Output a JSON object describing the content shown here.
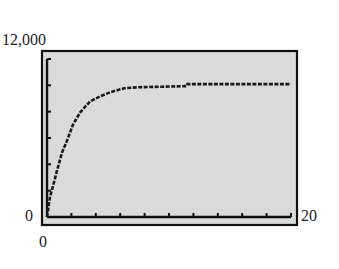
{
  "chart_data": {
    "type": "line",
    "title": "",
    "xlabel": "",
    "ylabel": "",
    "xlim": [
      0,
      20
    ],
    "ylim": [
      0,
      12000
    ],
    "x_tick_labels": {
      "min": "0",
      "max": "20"
    },
    "y_tick_labels": {
      "min": "0",
      "max": "12,000"
    },
    "x_tick_interval": 2,
    "y_tick_interval": 2000,
    "grid": false,
    "legend": null,
    "background": "#d9d9d9",
    "line_color": "#1a1a1a",
    "series": [
      {
        "name": "curve",
        "x": [
          0,
          0.25,
          0.5,
          0.82,
          1.23,
          1.65,
          2.14,
          2.72,
          3.54,
          4.36,
          5.19,
          6.34,
          7.57,
          9.5,
          11.44,
          11.52,
          14,
          17,
          20
        ],
        "y": [
          0,
          1530,
          2370,
          3520,
          4890,
          5810,
          7030,
          7950,
          8790,
          9170,
          9480,
          9780,
          9860,
          9900,
          9940,
          10090,
          10090,
          10090,
          10090
        ]
      }
    ]
  },
  "labels": {
    "y_max": "12,000",
    "y_min": "0",
    "x_min": "0",
    "x_max": "20"
  }
}
